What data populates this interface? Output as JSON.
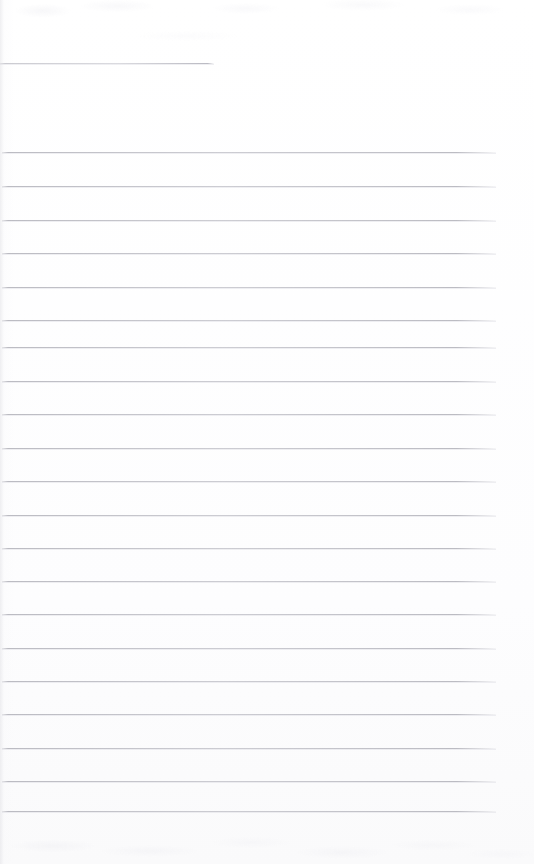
{
  "document": {
    "kind": "scanned-page",
    "page_label": "",
    "title": "",
    "subtitle": "",
    "body_text": "",
    "footer_text": "",
    "background_color": "#ffffff",
    "paper_color": "#fefefe",
    "rule_color": "#b0b0b8",
    "rule_color_light": "#d6d6dc",
    "page_width": 534,
    "page_height": 864
  },
  "header": {
    "rule": {
      "label": "",
      "x": 0,
      "y": 63,
      "width": 214
    }
  },
  "ruled_lines": {
    "count": 20,
    "left": 2,
    "right_end": 496,
    "first_y": 152,
    "spacing": 33.6,
    "items": [
      {
        "index": 1,
        "y": 152,
        "x": 2,
        "width": 494,
        "text": ""
      },
      {
        "index": 2,
        "y": 186,
        "x": 2,
        "width": 494,
        "text": ""
      },
      {
        "index": 3,
        "y": 220,
        "x": 2,
        "width": 494,
        "text": ""
      },
      {
        "index": 4,
        "y": 253,
        "x": 2,
        "width": 494,
        "text": ""
      },
      {
        "index": 5,
        "y": 287,
        "x": 2,
        "width": 494,
        "text": ""
      },
      {
        "index": 6,
        "y": 320,
        "x": 2,
        "width": 494,
        "text": ""
      },
      {
        "index": 7,
        "y": 347,
        "x": 2,
        "width": 494,
        "text": ""
      },
      {
        "index": 8,
        "y": 381,
        "x": 2,
        "width": 494,
        "text": ""
      },
      {
        "index": 9,
        "y": 414,
        "x": 2,
        "width": 494,
        "text": ""
      },
      {
        "index": 10,
        "y": 448,
        "x": 2,
        "width": 494,
        "text": ""
      },
      {
        "index": 11,
        "y": 481,
        "x": 2,
        "width": 494,
        "text": ""
      },
      {
        "index": 12,
        "y": 515,
        "x": 2,
        "width": 494,
        "text": ""
      },
      {
        "index": 13,
        "y": 548,
        "x": 2,
        "width": 494,
        "text": ""
      },
      {
        "index": 14,
        "y": 581,
        "x": 2,
        "width": 494,
        "text": ""
      },
      {
        "index": 15,
        "y": 614,
        "x": 2,
        "width": 494,
        "text": ""
      },
      {
        "index": 16,
        "y": 648,
        "x": 2,
        "width": 494,
        "text": ""
      },
      {
        "index": 17,
        "y": 681,
        "x": 2,
        "width": 494,
        "text": ""
      },
      {
        "index": 18,
        "y": 714,
        "x": 2,
        "width": 494,
        "text": ""
      },
      {
        "index": 19,
        "y": 748,
        "x": 2,
        "width": 494,
        "text": ""
      },
      {
        "index": 20,
        "y": 781,
        "x": 2,
        "width": 494,
        "text": ""
      },
      {
        "index": 21,
        "y": 811,
        "x": 2,
        "width": 494,
        "text": ""
      }
    ]
  },
  "margins": {
    "top_blank_height": 63,
    "bottom_blank_height": 53
  }
}
